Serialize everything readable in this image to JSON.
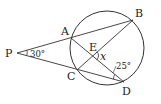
{
  "diagram": {
    "type": "geometry",
    "points": {
      "P": {
        "label": "P",
        "x": 17,
        "y": 53
      },
      "A": {
        "label": "A",
        "x": 71,
        "y": 38
      },
      "B": {
        "label": "B",
        "x": 133,
        "y": 20
      },
      "C": {
        "label": "C",
        "x": 77,
        "y": 70
      },
      "D": {
        "label": "D",
        "x": 124,
        "y": 82
      },
      "E": {
        "label": "E",
        "x": 92,
        "y": 56
      }
    },
    "circle": {
      "cx": 107,
      "cy": 48,
      "r": 37
    },
    "angles": {
      "angle_P": {
        "label": "30°",
        "value": 30
      },
      "angle_D": {
        "label": "25°",
        "value": 25
      },
      "angle_E": {
        "label": "x"
      }
    },
    "colors": {
      "stroke": "#333333",
      "text": "#222222"
    }
  }
}
